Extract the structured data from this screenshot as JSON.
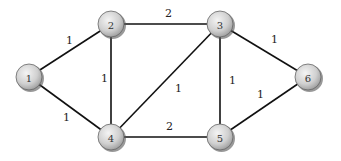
{
  "diagram": {
    "type": "weighted-undirected-graph",
    "nodes": [
      {
        "id": "1",
        "label": "1",
        "x": 29,
        "y": 77
      },
      {
        "id": "2",
        "label": "2",
        "x": 111,
        "y": 24
      },
      {
        "id": "3",
        "label": "3",
        "x": 220,
        "y": 24
      },
      {
        "id": "4",
        "label": "4",
        "x": 111,
        "y": 137
      },
      {
        "id": "5",
        "label": "5",
        "x": 220,
        "y": 137
      },
      {
        "id": "6",
        "label": "6",
        "x": 308,
        "y": 77
      }
    ],
    "edges": [
      {
        "from": "1",
        "to": "2",
        "weight": "1",
        "lx": 66,
        "ly": 44
      },
      {
        "from": "1",
        "to": "4",
        "weight": "1",
        "lx": 63,
        "ly": 121
      },
      {
        "from": "2",
        "to": "3",
        "weight": "2",
        "lx": 165,
        "ly": 17
      },
      {
        "from": "2",
        "to": "4",
        "weight": "1",
        "lx": 101,
        "ly": 82
      },
      {
        "from": "3",
        "to": "4",
        "weight": "1",
        "lx": 175,
        "ly": 92
      },
      {
        "from": "3",
        "to": "5",
        "weight": "1",
        "lx": 229,
        "ly": 84
      },
      {
        "from": "3",
        "to": "6",
        "weight": "1",
        "lx": 271,
        "ly": 43
      },
      {
        "from": "4",
        "to": "5",
        "weight": "2",
        "lx": 166,
        "ly": 130
      },
      {
        "from": "5",
        "to": "6",
        "weight": "1",
        "lx": 257,
        "ly": 98
      }
    ]
  }
}
